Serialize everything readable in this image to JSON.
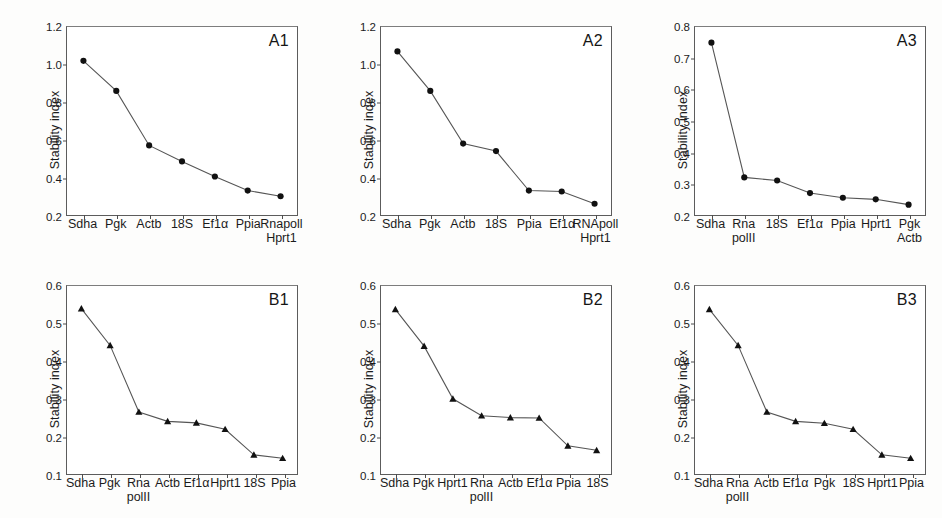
{
  "figure": {
    "ylabel": "Stability index",
    "marker_color": "#111111",
    "line_color": "#555555"
  },
  "chart_data": [
    {
      "type": "line",
      "title": "A1",
      "xlabel": "",
      "ylabel": "Stability index",
      "ylim": [
        0.2,
        1.2
      ],
      "yticks": [
        0.2,
        0.4,
        0.6,
        0.8,
        1.0,
        1.2
      ],
      "ytick_labels": [
        "0.2",
        "0.4",
        "0.6",
        "0.8",
        "1.0",
        "1.2"
      ],
      "grid": false,
      "legend": "none",
      "marker": "circle",
      "categories": [
        "Sdha",
        "Pgk",
        "Actb",
        "18S",
        "Ef1α",
        "Ppia",
        "Rnapoll\nHprt1"
      ],
      "category_lines": [
        [
          "Sdha",
          ""
        ],
        [
          "Pgk",
          ""
        ],
        [
          "Actb",
          ""
        ],
        [
          "18S",
          ""
        ],
        [
          "Ef1α",
          ""
        ],
        [
          "Ppia",
          ""
        ],
        [
          "Rnapoll",
          "Hprt1"
        ]
      ],
      "values": [
        1.02,
        0.86,
        0.57,
        0.485,
        0.405,
        0.33,
        0.3
      ]
    },
    {
      "type": "line",
      "title": "A2",
      "xlabel": "",
      "ylabel": "Stability index",
      "ylim": [
        0.2,
        1.2
      ],
      "yticks": [
        0.2,
        0.4,
        0.6,
        0.8,
        1.0,
        1.2
      ],
      "ytick_labels": [
        "0.2",
        "0.4",
        "0.6",
        "0.8",
        "1.0",
        "1.2"
      ],
      "grid": false,
      "legend": "none",
      "marker": "circle",
      "categories": [
        "Sdha",
        "Pgk",
        "Actb",
        "18S",
        "Ppia",
        "Ef1α",
        "RNApoll\nHprt1"
      ],
      "category_lines": [
        [
          "Sdha",
          ""
        ],
        [
          "Pgk",
          ""
        ],
        [
          "Actb",
          ""
        ],
        [
          "18S",
          ""
        ],
        [
          "Ppia",
          ""
        ],
        [
          "Ef1α",
          ""
        ],
        [
          "RNApoll",
          "Hprt1"
        ]
      ],
      "values": [
        1.07,
        0.86,
        0.58,
        0.54,
        0.33,
        0.325,
        0.26
      ]
    },
    {
      "type": "line",
      "title": "A3",
      "xlabel": "",
      "ylabel": "Stability index",
      "ylim": [
        0.2,
        0.8
      ],
      "yticks": [
        0.2,
        0.3,
        0.4,
        0.5,
        0.6,
        0.7,
        0.8
      ],
      "ytick_labels": [
        "0.2",
        "0.3",
        "0.4",
        "0.5",
        "0.6",
        "0.7",
        "0.8"
      ],
      "grid": false,
      "legend": "none",
      "marker": "circle",
      "categories": [
        "Sdha",
        "Rna polII",
        "18S",
        "Ef1α",
        "Ppia",
        "Hprt1",
        "Pgk\nActb"
      ],
      "category_lines": [
        [
          "Sdha",
          ""
        ],
        [
          "Rna",
          "polII"
        ],
        [
          "18S",
          ""
        ],
        [
          "Ef1α",
          ""
        ],
        [
          "Ppia",
          ""
        ],
        [
          "Hprt1",
          ""
        ],
        [
          "Pgk",
          "Actb"
        ]
      ],
      "values": [
        0.75,
        0.32,
        0.31,
        0.27,
        0.255,
        0.25,
        0.233
      ]
    },
    {
      "type": "line",
      "title": "B1",
      "xlabel": "",
      "ylabel": "Stability index",
      "ylim": [
        0.1,
        0.6
      ],
      "yticks": [
        0.1,
        0.2,
        0.3,
        0.4,
        0.5,
        0.6
      ],
      "ytick_labels": [
        "0.1",
        "0.2",
        "0.3",
        "0.4",
        "0.5",
        "0.6"
      ],
      "grid": false,
      "legend": "none",
      "marker": "triangle",
      "categories": [
        "Sdha",
        "Pgk",
        "Rna polII",
        "Actb",
        "Ef1α",
        "Hprt1",
        "18S",
        "Ppia"
      ],
      "category_lines": [
        [
          "Sdha",
          ""
        ],
        [
          "Pgk",
          ""
        ],
        [
          "Rna",
          "polII"
        ],
        [
          "Actb",
          ""
        ],
        [
          "Ef1α",
          ""
        ],
        [
          "Hprt1",
          ""
        ],
        [
          "18S",
          ""
        ],
        [
          "Ppia",
          ""
        ]
      ],
      "values": [
        0.54,
        0.442,
        0.265,
        0.24,
        0.236,
        0.219,
        0.151,
        0.142
      ]
    },
    {
      "type": "line",
      "title": "B2",
      "xlabel": "",
      "ylabel": "Stability index",
      "ylim": [
        0.1,
        0.6
      ],
      "yticks": [
        0.1,
        0.2,
        0.3,
        0.4,
        0.5,
        0.6
      ],
      "ytick_labels": [
        "0.1",
        "0.2",
        "0.3",
        "0.4",
        "0.5",
        "0.6"
      ],
      "grid": false,
      "legend": "none",
      "marker": "triangle",
      "categories": [
        "Sdha",
        "Pgk",
        "Hprt1",
        "Rna polII",
        "Actb",
        "Ef1α",
        "Ppia",
        "18S"
      ],
      "category_lines": [
        [
          "Sdha",
          ""
        ],
        [
          "Pgk",
          ""
        ],
        [
          "Hprt1",
          ""
        ],
        [
          "Rna",
          "polII"
        ],
        [
          "Actb",
          ""
        ],
        [
          "Ef1α",
          ""
        ],
        [
          "Ppia",
          ""
        ],
        [
          "18S",
          ""
        ]
      ],
      "values": [
        0.538,
        0.44,
        0.3,
        0.255,
        0.25,
        0.249,
        0.175,
        0.163
      ]
    },
    {
      "type": "line",
      "title": "B3",
      "xlabel": "",
      "ylabel": "Stability index",
      "ylim": [
        0.1,
        0.6
      ],
      "yticks": [
        0.1,
        0.2,
        0.3,
        0.4,
        0.5,
        0.6
      ],
      "ytick_labels": [
        "0.1",
        "0.2",
        "0.3",
        "0.4",
        "0.5",
        "0.6"
      ],
      "grid": false,
      "legend": "none",
      "marker": "triangle",
      "categories": [
        "Sdha",
        "Rna polII",
        "Actb",
        "Ef1α",
        "Pgk",
        "18S",
        "Hprt1",
        "Ppia"
      ],
      "category_lines": [
        [
          "Sdha",
          ""
        ],
        [
          "Rna",
          "polII"
        ],
        [
          "Actb",
          ""
        ],
        [
          "Ef1α",
          ""
        ],
        [
          "Pgk",
          ""
        ],
        [
          "18S",
          ""
        ],
        [
          "Hprt1",
          ""
        ],
        [
          "Ppia",
          ""
        ]
      ],
      "values": [
        0.538,
        0.442,
        0.265,
        0.24,
        0.235,
        0.219,
        0.151,
        0.142
      ]
    }
  ]
}
